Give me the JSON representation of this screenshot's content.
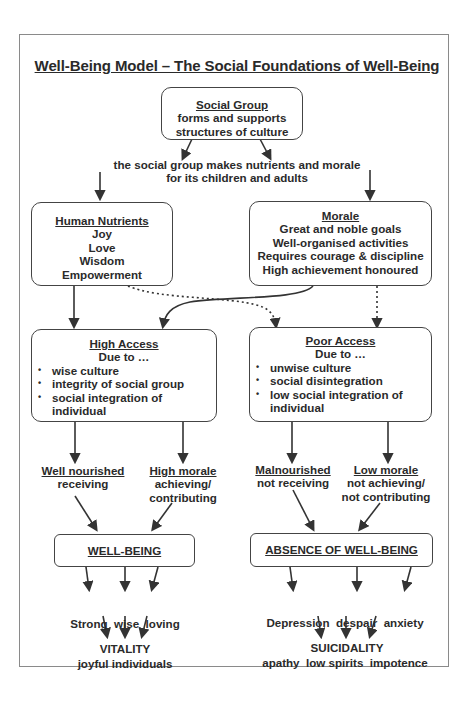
{
  "title": "Well-Being Model – The Social Foundations of Well-Being",
  "social_group": {
    "heading": "Social Group",
    "lines": [
      "forms and supports",
      "structures of culture"
    ]
  },
  "connector_text": [
    "the social group makes nutrients and morale",
    "for its children and adults"
  ],
  "human_nutrients": {
    "heading": "Human Nutrients",
    "items": [
      "Joy",
      "Love",
      "Wisdom",
      "Empowerment"
    ]
  },
  "morale": {
    "heading": "Morale",
    "items": [
      "Great and noble goals",
      "Well-organised activities",
      "Requires courage & discipline",
      "High achievement honoured"
    ]
  },
  "high_access": {
    "heading": "High Access",
    "subheading": "Due to …",
    "bullets": [
      "wise culture",
      "integrity of social group",
      "social integration of individual"
    ]
  },
  "poor_access": {
    "heading": "Poor Access",
    "subheading": "Due to …",
    "bullets": [
      "unwise culture",
      "social disintegration",
      "low social integration of individual"
    ]
  },
  "outcomes_left": {
    "well_nourished": {
      "heading": "Well nourished",
      "sub": "receiving"
    },
    "high_morale": {
      "heading": "High morale",
      "sub": [
        "achieving/",
        "contributing"
      ]
    }
  },
  "outcomes_right": {
    "malnourished": {
      "heading": "Malnourished",
      "sub": "not receiving"
    },
    "low_morale": {
      "heading": "Low morale",
      "sub": [
        "not achieving/",
        "not contributing"
      ]
    }
  },
  "well_being": {
    "heading": "WELL-BEING",
    "traits": [
      "Strong  wise  loving",
      "joyful individuals"
    ],
    "result": "VITALITY"
  },
  "absence": {
    "heading": "ABSENCE OF WELL-BEING",
    "traits": [
      "Depression  despair  anxiety",
      "apathy  low spirits  impotence"
    ],
    "result": "SUICIDALITY"
  }
}
